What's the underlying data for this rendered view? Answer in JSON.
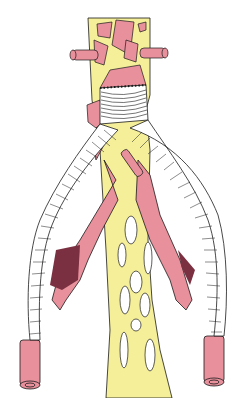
{
  "figure": {
    "colors": {
      "artery": "#e8909c",
      "artery_dark": "#6a2a3a",
      "fat": "#f5ef9a",
      "graft": "#ffffff",
      "outline": "#1a1a1a",
      "background": "#ffffff"
    },
    "labels": []
  }
}
